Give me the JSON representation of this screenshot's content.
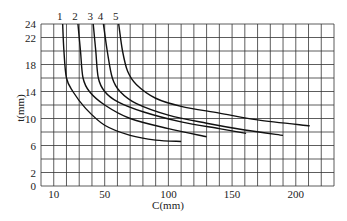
{
  "chart_data": {
    "type": "line",
    "title": "",
    "xlabel": "C(mm)",
    "ylabel": "t(mm)",
    "xlim": [
      0,
      230
    ],
    "ylim": [
      0,
      24
    ],
    "grid": true,
    "legend": "inline labels at top of curves",
    "x_ticks": [
      10,
      50,
      100,
      150,
      200
    ],
    "y_ticks": [
      0,
      2,
      6,
      10,
      14,
      18,
      22,
      24
    ],
    "x_grid_step": 10,
    "y_grid_step": 2,
    "series": [
      {
        "name": "1",
        "points": [
          [
            17,
            24
          ],
          [
            18,
            20
          ],
          [
            20,
            16
          ],
          [
            25,
            14
          ],
          [
            35,
            11.5
          ],
          [
            50,
            9
          ],
          [
            70,
            7.5
          ],
          [
            90,
            6.8
          ],
          [
            110,
            6.6
          ]
        ]
      },
      {
        "name": "2",
        "points": [
          [
            29,
            24
          ],
          [
            31,
            20
          ],
          [
            33,
            16
          ],
          [
            38,
            14
          ],
          [
            50,
            12
          ],
          [
            70,
            10
          ],
          [
            100,
            8.5
          ],
          [
            130,
            7.3
          ]
        ]
      },
      {
        "name": "3",
        "points": [
          [
            41,
            24
          ],
          [
            43,
            20
          ],
          [
            45,
            16
          ],
          [
            50,
            14
          ],
          [
            60,
            12.5
          ],
          [
            80,
            11
          ],
          [
            110,
            9.5
          ],
          [
            140,
            8.5
          ],
          [
            161,
            7.8
          ]
        ]
      },
      {
        "name": "4",
        "points": [
          [
            49,
            24
          ],
          [
            52,
            20
          ],
          [
            56,
            16
          ],
          [
            62,
            14
          ],
          [
            75,
            12.2
          ],
          [
            100,
            10.5
          ],
          [
            130,
            9.3
          ],
          [
            160,
            8.3
          ],
          [
            190,
            7.5
          ]
        ]
      },
      {
        "name": "5",
        "points": [
          [
            61,
            24
          ],
          [
            64,
            20
          ],
          [
            68,
            17
          ],
          [
            75,
            15
          ],
          [
            90,
            13
          ],
          [
            110,
            11.8
          ],
          [
            140,
            10.8
          ],
          [
            170,
            9.8
          ],
          [
            211,
            8.9
          ]
        ]
      }
    ]
  }
}
